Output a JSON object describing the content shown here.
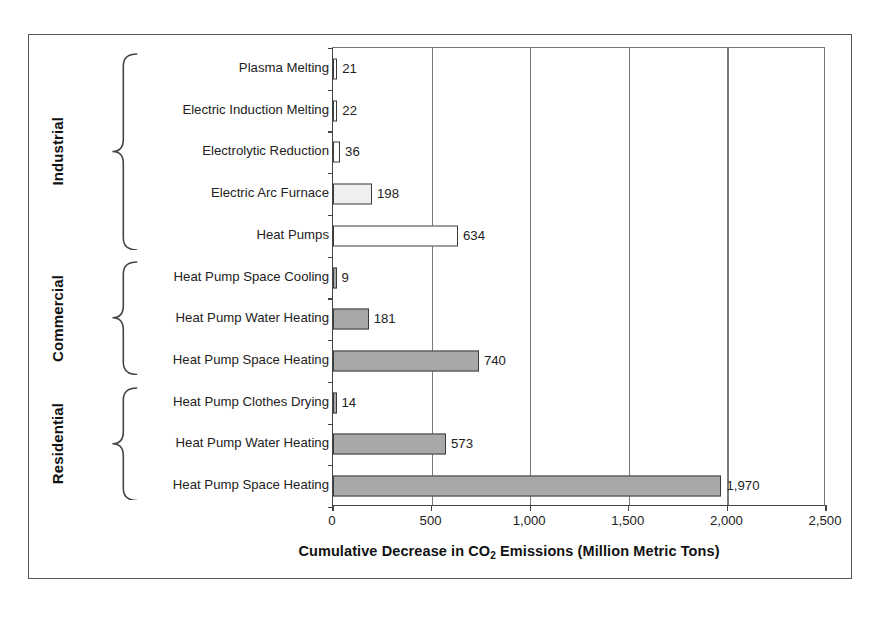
{
  "chart_data": {
    "type": "bar",
    "orientation": "horizontal",
    "title": "",
    "xlabel_parts": {
      "before": "Cumulative Decrease in CO",
      "sub": "2",
      "after": " Emissions (Million Metric Tons)"
    },
    "xlabel": "Cumulative Decrease in CO2 Emissions (Million Metric Tons)",
    "ylabel": "",
    "xlim": [
      0,
      2500
    ],
    "xticks": [
      0,
      500,
      1000,
      1500,
      2000,
      2500
    ],
    "xtick_labels": [
      "0",
      "500",
      "1,000",
      "1,500",
      "2,000",
      "2,500"
    ],
    "grid": "vertical",
    "legend": "none",
    "categories": [
      "Plasma Melting",
      "Electric Induction Melting",
      "Electrolytic Reduction",
      "Electric Arc Furnace",
      "Heat Pumps",
      "Heat Pump Space Cooling",
      "Heat Pump Water Heating",
      "Heat Pump Space Heating",
      "Heat Pump Clothes Drying",
      "Heat Pump Water Heating",
      "Heat Pump Space Heating"
    ],
    "values": [
      21,
      22,
      36,
      198,
      634,
      9,
      181,
      740,
      14,
      573,
      1970
    ],
    "value_labels": [
      "21",
      "22",
      "36",
      "198",
      "634",
      "9",
      "181",
      "740",
      "14",
      "573",
      "1,970"
    ],
    "bars": [
      {
        "label": "Plasma Melting",
        "value": 21,
        "value_label": "21",
        "group": "Industrial",
        "fill": "#ffffff"
      },
      {
        "label": "Electric Induction Melting",
        "value": 22,
        "value_label": "22",
        "group": "Industrial",
        "fill": "#ffffff"
      },
      {
        "label": "Electrolytic Reduction",
        "value": 36,
        "value_label": "36",
        "group": "Industrial",
        "fill": "#ffffff"
      },
      {
        "label": "Electric Arc Furnace",
        "value": 198,
        "value_label": "198",
        "group": "Industrial",
        "fill": "#efefef"
      },
      {
        "label": "Heat Pumps",
        "value": 634,
        "value_label": "634",
        "group": "Industrial",
        "fill": "#ffffff"
      },
      {
        "label": "Heat Pump Space Cooling",
        "value": 9,
        "value_label": "9",
        "group": "Commercial",
        "fill": "#a8a8a8"
      },
      {
        "label": "Heat Pump Water Heating",
        "value": 181,
        "value_label": "181",
        "group": "Commercial",
        "fill": "#a8a8a8"
      },
      {
        "label": "Heat Pump Space Heating",
        "value": 740,
        "value_label": "740",
        "group": "Commercial",
        "fill": "#a8a8a8"
      },
      {
        "label": "Heat Pump Clothes Drying",
        "value": 14,
        "value_label": "14",
        "group": "Residential",
        "fill": "#a8a8a8"
      },
      {
        "label": "Heat Pump Water Heating",
        "value": 573,
        "value_label": "573",
        "group": "Residential",
        "fill": "#a8a8a8"
      },
      {
        "label": "Heat Pump Space Heating",
        "value": 1970,
        "value_label": "1,970",
        "group": "Residential",
        "fill": "#a8a8a8"
      }
    ],
    "groups": [
      {
        "name": "Industrial",
        "first_index": 0,
        "last_index": 4
      },
      {
        "name": "Commercial",
        "first_index": 5,
        "last_index": 7
      },
      {
        "name": "Residential",
        "first_index": 8,
        "last_index": 10
      }
    ]
  },
  "colors": {
    "bar_gray": "#a8a8a8",
    "bar_light": "#efefef",
    "bar_white": "#ffffff",
    "bar_outline": "#3a3a3a",
    "gridline": "#7a7a7a",
    "frame": "#555555",
    "text": "#1a1a1a"
  }
}
